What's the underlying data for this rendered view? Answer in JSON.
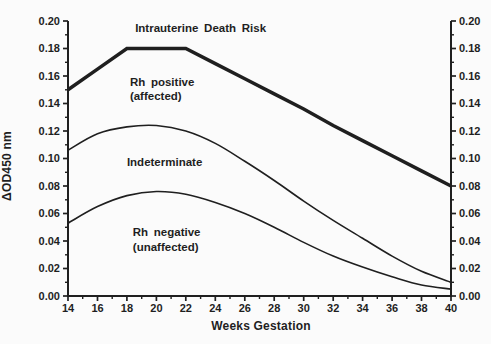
{
  "figure": {
    "background": "#fbfbfb",
    "ink": "#1f1f1f"
  },
  "chart_data": {
    "type": "line",
    "title": "",
    "xlabel": "Weeks Gestation",
    "ylabel": "ΔOD450 nm",
    "xlim": [
      14,
      40
    ],
    "ylim": [
      0,
      0.2
    ],
    "grid": false,
    "legend": "none - zones labeled by in-plot annotations",
    "x_axis": {
      "major_ticks": [
        14,
        16,
        18,
        20,
        22,
        24,
        26,
        28,
        30,
        32,
        34,
        36,
        38,
        40
      ],
      "tick_labels": [
        "14",
        "16",
        "18",
        "20",
        "22",
        "24",
        "26",
        "28",
        "30",
        "32",
        "34",
        "36",
        "38",
        "40"
      ],
      "minor_tick_step": 1
    },
    "y_axis": {
      "major_ticks": [
        0,
        0.02,
        0.04,
        0.06,
        0.08,
        0.1,
        0.12,
        0.14,
        0.16,
        0.18,
        0.2
      ],
      "tick_labels": [
        "0.00",
        "0.02",
        "0.04",
        "0.06",
        "0.08",
        "0.10",
        "0.12",
        "0.14",
        "0.16",
        "0.18",
        "0.20"
      ],
      "minor_tick_step": 0.01,
      "labeled_sides": [
        "left",
        "right"
      ]
    },
    "x": [
      14,
      16,
      18,
      20,
      22,
      24,
      26,
      28,
      30,
      32,
      34,
      36,
      38,
      40
    ],
    "series": [
      {
        "name": "Intrauterine Death Risk boundary",
        "data_name": "risk-line",
        "values": [
          0.15,
          0.165,
          0.18,
          0.18,
          0.18,
          0.169,
          0.158,
          0.147,
          0.136,
          0.124,
          0.113,
          0.102,
          0.091,
          0.08
        ],
        "stroke_width": 3.5,
        "interpolation": "linear"
      },
      {
        "name": "Indeterminate upper boundary",
        "data_name": "indeterminate-curve",
        "values": [
          0.106,
          0.118,
          0.123,
          0.124,
          0.12,
          0.111,
          0.098,
          0.084,
          0.069,
          0.055,
          0.042,
          0.029,
          0.018,
          0.01
        ],
        "stroke_width": 1.6,
        "interpolation": "smooth"
      },
      {
        "name": "Rh negative (unaffected) curve",
        "data_name": "rh-negative-curve",
        "values": [
          0.053,
          0.065,
          0.073,
          0.076,
          0.074,
          0.068,
          0.06,
          0.05,
          0.039,
          0.029,
          0.021,
          0.014,
          0.008,
          0.005
        ],
        "stroke_width": 1.6,
        "interpolation": "smooth"
      }
    ],
    "annotations": [
      {
        "data_name": "label-intrauterine-death-risk",
        "lines": [
          "Intrauterine Death Risk"
        ],
        "x": 23.0,
        "y": 0.195,
        "anchor": "middle"
      },
      {
        "data_name": "label-rh-positive",
        "lines": [
          "Rh positive",
          "(affected)"
        ],
        "x": 18.2,
        "y": 0.156,
        "anchor": "start"
      },
      {
        "data_name": "label-indeterminate",
        "lines": [
          "Indeterminate"
        ],
        "x": 18.0,
        "y": 0.0975,
        "anchor": "start"
      },
      {
        "data_name": "label-rh-negative",
        "lines": [
          "Rh negative",
          "(unaffected)"
        ],
        "x": 18.4,
        "y": 0.0465,
        "anchor": "start"
      }
    ]
  }
}
